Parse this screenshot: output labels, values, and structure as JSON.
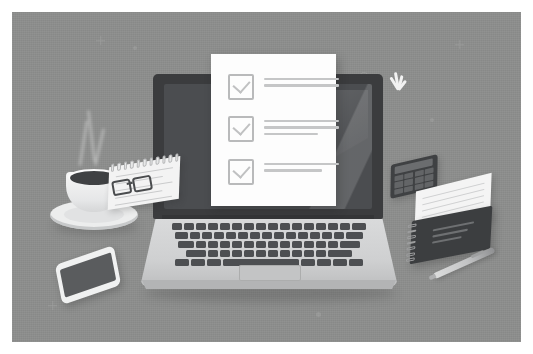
{
  "illustration": {
    "title": "Checklist on laptop screen desk scene",
    "background_color": "#8d8e8d",
    "frame_color": "#ffffff"
  },
  "laptop": {
    "name": "open-laptop",
    "screen_bezel_color": "#3b3c3e",
    "screen_color": "#4b4d50",
    "base_color": "#d9dadb",
    "key_color": "#4d4f52",
    "keyboard_rows": [
      [
        10,
        10,
        10,
        10,
        10,
        10,
        10,
        10,
        10,
        10,
        10,
        10,
        10,
        10,
        10,
        14
      ],
      [
        13,
        10,
        10,
        10,
        10,
        10,
        10,
        10,
        10,
        10,
        10,
        10,
        10,
        10,
        17
      ],
      [
        16,
        10,
        10,
        10,
        10,
        10,
        10,
        10,
        10,
        10,
        10,
        10,
        10,
        20
      ],
      [
        20,
        10,
        10,
        10,
        10,
        10,
        10,
        10,
        10,
        10,
        10,
        24
      ],
      [
        14,
        14,
        14,
        76,
        14,
        14,
        14,
        14
      ]
    ],
    "trackpad_label": "trackpad"
  },
  "document": {
    "name": "checklist-document",
    "paper_color": "#fdfdfd",
    "checkbox_border_color": "#b9babb",
    "line_color": "#c5c6c7",
    "items": [
      {
        "checked": true,
        "line_widths": [
          75,
          75
        ]
      },
      {
        "checked": true,
        "line_widths": [
          75,
          75,
          54
        ]
      },
      {
        "checked": true,
        "line_widths": [
          75,
          58
        ]
      }
    ]
  },
  "sparkle": {
    "name": "sparkle",
    "color": "#f2f2f2",
    "rays": [
      {
        "angle": -32,
        "length": 15,
        "width": 3
      },
      {
        "angle": -10,
        "length": 18,
        "width": 3
      },
      {
        "angle": 14,
        "length": 15,
        "width": 3
      },
      {
        "angle": 38,
        "length": 12,
        "width": 3
      }
    ]
  },
  "desk_items": {
    "coffee": {
      "name": "coffee-cup",
      "cup_color": "#f6f6f6",
      "coffee_color": "#3f4143",
      "saucer_color": "#eceded",
      "steam_count": 3
    },
    "notepad": {
      "name": "spiral-notepad",
      "paper_color": "#f3f3f3",
      "line_count": 5
    },
    "glasses": {
      "name": "eyeglasses",
      "frame_color": "#4a4c4e"
    },
    "phone": {
      "name": "smartphone",
      "body_color": "#f0f1f1",
      "screen_color": "#5a5c5e"
    },
    "calculator": {
      "name": "calculator",
      "body_color": "#3f4143",
      "key_count": 12
    },
    "paper_sheet": {
      "name": "paper-sheet",
      "color": "#f4f4f4",
      "line_count": 6
    },
    "notebook": {
      "name": "spiral-notebook",
      "cover_color": "#3c3e40",
      "line_count": 3
    },
    "pen": {
      "name": "pen",
      "color": "#c3c4c5"
    }
  }
}
